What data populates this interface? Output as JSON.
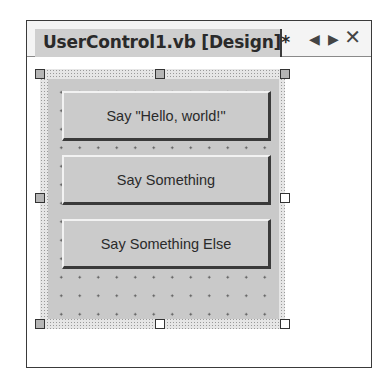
{
  "tab": {
    "title": "UserControl1.vb [Design]*",
    "nav_left": "◀",
    "nav_right": "▶",
    "close": "✕"
  },
  "designer": {
    "buttons": [
      {
        "label": "Say \"Hello, world!\""
      },
      {
        "label": "Say Something"
      },
      {
        "label": "Say Something Else"
      }
    ]
  }
}
